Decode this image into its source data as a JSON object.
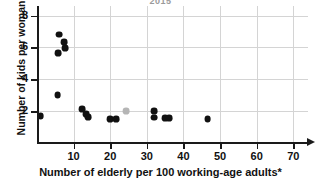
{
  "chart_data": {
    "type": "scatter",
    "title": "2015",
    "xlabel": "Number of elderly per 100 working-age adults*",
    "ylabel": "Number of kids per woman",
    "xlim": [
      0,
      74
    ],
    "ylim": [
      0,
      8.6
    ],
    "xticks": [
      10,
      20,
      30,
      40,
      50,
      60,
      70
    ],
    "yticks": [
      2,
      4,
      6,
      8
    ],
    "grid": true,
    "legend": "none",
    "points": [
      {
        "x": 1.0,
        "y": 1.7,
        "color": "#111111"
      },
      {
        "x": 5.8,
        "y": 5.65,
        "color": "#111111"
      },
      {
        "x": 6.0,
        "y": 6.8,
        "color": "#111111"
      },
      {
        "x": 7.4,
        "y": 6.35,
        "color": "#111111"
      },
      {
        "x": 7.6,
        "y": 5.95,
        "color": "#111111"
      },
      {
        "x": 5.6,
        "y": 3.0,
        "color": "#111111"
      },
      {
        "x": 12.4,
        "y": 2.15,
        "color": "#111111"
      },
      {
        "x": 13.4,
        "y": 1.8,
        "color": "#111111"
      },
      {
        "x": 14.0,
        "y": 1.62,
        "color": "#111111"
      },
      {
        "x": 19.9,
        "y": 1.52,
        "color": "#111111"
      },
      {
        "x": 21.5,
        "y": 1.52,
        "color": "#111111"
      },
      {
        "x": 24.3,
        "y": 2.0,
        "color": "#b5b5b5"
      },
      {
        "x": 31.9,
        "y": 2.0,
        "color": "#111111"
      },
      {
        "x": 31.9,
        "y": 1.6,
        "color": "#111111"
      },
      {
        "x": 34.9,
        "y": 1.55,
        "color": "#111111"
      },
      {
        "x": 36.1,
        "y": 1.55,
        "color": "#111111"
      },
      {
        "x": 46.6,
        "y": 1.5,
        "color": "#111111"
      }
    ],
    "point_radius_px": 3.4,
    "colors": {
      "axis": "#1a1a1a",
      "grid": "#d4d4d4",
      "point": "#111111",
      "highlight_point": "#b5b5b5",
      "title": "#9a9a9a"
    }
  }
}
